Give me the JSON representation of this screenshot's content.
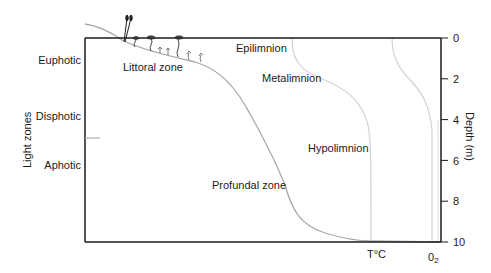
{
  "diagram": {
    "light_zones": {
      "axis_title": "Light zones",
      "labels": [
        "Euphotic",
        "Disphotic",
        "Aphotic"
      ]
    },
    "thermal_strata": [
      "Epilimnion",
      "Metalimnion",
      "Hypolimnion"
    ],
    "benthic_zones": [
      "Littoral zone",
      "Profundal zone"
    ],
    "depth_axis": {
      "title": "Depth (m)",
      "ticks": [
        "0",
        "2",
        "4",
        "6",
        "8",
        "10"
      ],
      "range": [
        0,
        10
      ]
    },
    "profile_labels": {
      "temperature": "T°C",
      "oxygen_main": "0",
      "oxygen_sub": "2"
    },
    "colors": {
      "frame": "#1a1a1a",
      "lake_bottom": "#a0a0a0",
      "temperature_curve": "#d0d0d0",
      "oxygen_curve": "#d0d0d0",
      "plants": "#333333",
      "text": "#1a1a1a"
    }
  }
}
